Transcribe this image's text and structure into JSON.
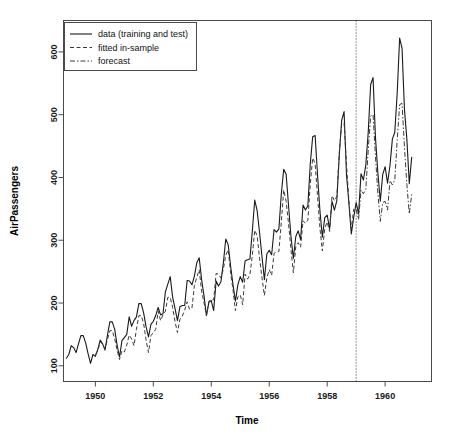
{
  "chart_data": {
    "type": "line",
    "title": "",
    "xlabel": "Time",
    "ylabel": "AirPassengers",
    "xlim": [
      1948.9,
      1961.6
    ],
    "ylim": [
      75,
      650
    ],
    "grid": false,
    "xticks": [
      1950,
      1952,
      1954,
      1956,
      1958,
      1960
    ],
    "xticklabels": [
      "1950",
      "1952",
      "1954",
      "1956",
      "1958",
      "1960"
    ],
    "yticks": [
      100,
      200,
      300,
      400,
      500,
      600
    ],
    "yticklabels": [
      "100",
      "200",
      "300",
      "400",
      "500",
      "600"
    ],
    "legend": {
      "position": "top-left",
      "entries": [
        {
          "label": "data (training and test)",
          "style": "solid",
          "color": "#1a1a1a"
        },
        {
          "label": "fitted in-sample",
          "style": "dashed",
          "color": "#3a3a3a"
        },
        {
          "label": "forecast",
          "style": "dashdot",
          "color": "#3a3a3a"
        }
      ]
    },
    "annotations": [
      {
        "type": "vline",
        "x": 1959.0,
        "style": "dotted",
        "label": "train/test split"
      }
    ],
    "x": [
      1949.0,
      1949.083,
      1949.167,
      1949.25,
      1949.333,
      1949.417,
      1949.5,
      1949.583,
      1949.667,
      1949.75,
      1949.833,
      1949.917,
      1950.0,
      1950.083,
      1950.167,
      1950.25,
      1950.333,
      1950.417,
      1950.5,
      1950.583,
      1950.667,
      1950.75,
      1950.833,
      1950.917,
      1951.0,
      1951.083,
      1951.167,
      1951.25,
      1951.333,
      1951.417,
      1951.5,
      1951.583,
      1951.667,
      1951.75,
      1951.833,
      1951.917,
      1952.0,
      1952.083,
      1952.167,
      1952.25,
      1952.333,
      1952.417,
      1952.5,
      1952.583,
      1952.667,
      1952.75,
      1952.833,
      1952.917,
      1953.0,
      1953.083,
      1953.167,
      1953.25,
      1953.333,
      1953.417,
      1953.5,
      1953.583,
      1953.667,
      1953.75,
      1953.833,
      1953.917,
      1954.0,
      1954.083,
      1954.167,
      1954.25,
      1954.333,
      1954.417,
      1954.5,
      1954.583,
      1954.667,
      1954.75,
      1954.833,
      1954.917,
      1955.0,
      1955.083,
      1955.167,
      1955.25,
      1955.333,
      1955.417,
      1955.5,
      1955.583,
      1955.667,
      1955.75,
      1955.833,
      1955.917,
      1956.0,
      1956.083,
      1956.167,
      1956.25,
      1956.333,
      1956.417,
      1956.5,
      1956.583,
      1956.667,
      1956.75,
      1956.833,
      1956.917,
      1957.0,
      1957.083,
      1957.167,
      1957.25,
      1957.333,
      1957.417,
      1957.5,
      1957.583,
      1957.667,
      1957.75,
      1957.833,
      1957.917,
      1958.0,
      1958.083,
      1958.167,
      1958.25,
      1958.333,
      1958.417,
      1958.5,
      1958.583,
      1958.667,
      1958.75,
      1958.833,
      1958.917,
      1959.0,
      1959.083,
      1959.167,
      1959.25,
      1959.333,
      1959.417,
      1959.5,
      1959.583,
      1959.667,
      1959.75,
      1959.833,
      1959.917,
      1960.0,
      1960.083,
      1960.167,
      1960.25,
      1960.333,
      1960.417,
      1960.5,
      1960.583,
      1960.667,
      1960.75,
      1960.833,
      1960.917
    ],
    "series": [
      {
        "name": "data (training and test)",
        "style": "solid",
        "values": [
          112,
          118,
          132,
          129,
          121,
          135,
          148,
          148,
          136,
          119,
          104,
          118,
          115,
          126,
          141,
          135,
          125,
          149,
          170,
          170,
          158,
          133,
          114,
          140,
          145,
          150,
          178,
          163,
          172,
          178,
          199,
          199,
          184,
          162,
          146,
          166,
          171,
          180,
          193,
          181,
          183,
          218,
          230,
          242,
          209,
          191,
          172,
          194,
          196,
          196,
          236,
          235,
          229,
          243,
          264,
          272,
          237,
          211,
          180,
          201,
          204,
          188,
          235,
          227,
          234,
          264,
          302,
          293,
          259,
          229,
          203,
          229,
          242,
          233,
          267,
          269,
          270,
          315,
          364,
          347,
          312,
          274,
          237,
          278,
          284,
          277,
          317,
          313,
          318,
          374,
          413,
          405,
          355,
          306,
          271,
          306,
          315,
          301,
          356,
          348,
          355,
          422,
          465,
          467,
          404,
          347,
          305,
          336,
          340,
          318,
          362,
          348,
          363,
          435,
          491,
          505,
          404,
          359,
          310,
          337,
          360,
          342,
          406,
          396,
          420,
          472,
          548,
          559,
          463,
          407,
          362,
          405,
          417,
          391,
          419,
          461,
          472,
          535,
          622,
          606,
          508,
          461,
          390,
          432
        ]
      },
      {
        "name": "fitted in-sample",
        "style": "dashed",
        "train_end_x": 1959.0,
        "values": [
          null,
          null,
          null,
          null,
          null,
          null,
          null,
          null,
          null,
          null,
          null,
          null,
          118,
          124,
          138,
          135,
          127,
          142,
          156,
          156,
          143,
          125,
          110,
          124,
          122,
          133,
          149,
          143,
          132,
          158,
          180,
          180,
          167,
          141,
          121,
          148,
          153,
          158,
          187,
          172,
          181,
          187,
          209,
          209,
          193,
          170,
          153,
          174,
          179,
          189,
          202,
          190,
          192,
          228,
          241,
          253,
          219,
          200,
          180,
          203,
          205,
          205,
          247,
          246,
          240,
          254,
          276,
          285,
          248,
          221,
          188,
          210,
          213,
          197,
          246,
          238,
          245,
          276,
          316,
          307,
          271,
          240,
          212,
          240,
          253,
          244,
          279,
          281,
          282,
          329,
          380,
          362,
          326,
          286,
          248,
          290,
          296,
          289,
          331,
          327,
          332,
          390,
          431,
          422,
          370,
          319,
          283,
          319,
          329,
          314,
          371,
          363,
          370,
          440,
          485,
          487,
          421,
          362,
          318,
          350,
          null,
          null,
          null,
          null,
          null,
          null,
          null,
          null,
          null,
          null,
          null,
          null,
          null,
          null,
          null,
          null,
          null,
          null,
          null,
          null,
          null,
          null,
          null,
          null
        ]
      },
      {
        "name": "forecast",
        "style": "dashdot",
        "forecast_start_x": 1959.0,
        "values": [
          null,
          null,
          null,
          null,
          null,
          null,
          null,
          null,
          null,
          null,
          null,
          null,
          null,
          null,
          null,
          null,
          null,
          null,
          null,
          null,
          null,
          null,
          null,
          null,
          null,
          null,
          null,
          null,
          null,
          null,
          null,
          null,
          null,
          null,
          null,
          null,
          null,
          null,
          null,
          null,
          null,
          null,
          null,
          null,
          null,
          null,
          null,
          null,
          null,
          null,
          null,
          null,
          null,
          null,
          null,
          null,
          null,
          null,
          null,
          null,
          null,
          null,
          null,
          null,
          null,
          null,
          null,
          null,
          null,
          null,
          null,
          null,
          null,
          null,
          null,
          null,
          null,
          null,
          null,
          null,
          null,
          null,
          null,
          null,
          null,
          null,
          null,
          null,
          null,
          null,
          null,
          null,
          null,
          null,
          null,
          null,
          null,
          null,
          null,
          null,
          null,
          null,
          null,
          null,
          null,
          null,
          null,
          null,
          null,
          null,
          null,
          null,
          null,
          null,
          null,
          null,
          null,
          null,
          null,
          null,
          349,
          333,
          380,
          374,
          381,
          444,
          498,
          500,
          433,
          375,
          330,
          360,
          362,
          348,
          395,
          388,
          396,
          460,
          516,
          518,
          448,
          389,
          342,
          373
        ]
      }
    ]
  }
}
